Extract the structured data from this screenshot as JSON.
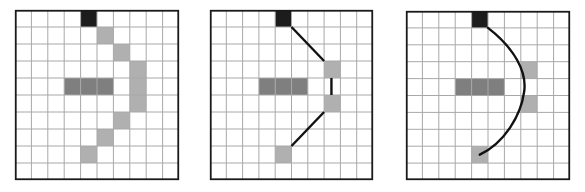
{
  "diagram": {
    "grid": {
      "cols": 10,
      "rows": 10
    },
    "colors": {
      "background": "#ffffff",
      "grid_line": "#a8a8a8",
      "border": "#1a1a1a",
      "start_cell": "#1c1c1c",
      "obstacle_cell": "#7f7f7f",
      "path_cell": "#b0b0b0",
      "path_line": "#111111"
    },
    "panels": [
      {
        "id": "grid-path-cells",
        "x": 15,
        "y": 10,
        "width": 164,
        "height": 170,
        "start": [
          4,
          0
        ],
        "obstacles": [
          [
            3,
            4
          ],
          [
            4,
            4
          ],
          [
            5,
            4
          ]
        ],
        "path_cells": [
          [
            5,
            1
          ],
          [
            6,
            2
          ],
          [
            7,
            3
          ],
          [
            7,
            4
          ],
          [
            7,
            5
          ],
          [
            6,
            6
          ],
          [
            5,
            7
          ],
          [
            4,
            8
          ]
        ],
        "lines": [],
        "curve": null
      },
      {
        "id": "waypoint-segments",
        "x": 210,
        "y": 10,
        "width": 163,
        "height": 170,
        "start": [
          4,
          0
        ],
        "obstacles": [
          [
            3,
            4
          ],
          [
            4,
            4
          ],
          [
            5,
            4
          ]
        ],
        "path_cells": [
          [
            7,
            3
          ],
          [
            7,
            5
          ],
          [
            4,
            8
          ]
        ],
        "lines": [
          [
            [
              5,
              1
            ],
            [
              7,
              3
            ]
          ],
          [
            [
              7.45,
              4
            ],
            [
              7.45,
              5
            ]
          ],
          [
            [
              7,
              6
            ],
            [
              5,
              8
            ]
          ]
        ],
        "curve": null
      },
      {
        "id": "smoothed-curve",
        "x": 406,
        "y": 11,
        "width": 164,
        "height": 169,
        "start": [
          4,
          0
        ],
        "obstacles": [
          [
            3,
            4
          ],
          [
            4,
            4
          ],
          [
            5,
            4
          ]
        ],
        "path_cells": [
          [
            7,
            3
          ],
          [
            7,
            5
          ],
          [
            4,
            8
          ]
        ],
        "lines": [],
        "curve": "M5,1 C6.6,2.2 7.4,3.6 7.2,4.8 C7,6.2 6,7.8 4.5,8.5"
      }
    ]
  }
}
